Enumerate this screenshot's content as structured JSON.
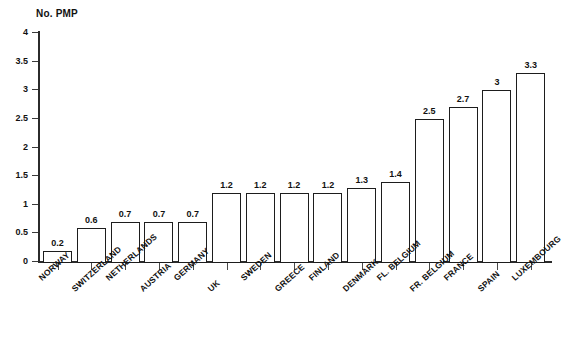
{
  "chart_data": {
    "type": "bar",
    "title": "No. PMP",
    "xlabel": "",
    "ylabel": "No. PMP",
    "ylim": [
      0,
      4
    ],
    "ytick_labels": [
      "0",
      "0.5",
      "1",
      "1.5",
      "2",
      "2.5",
      "3",
      "3.5",
      "4"
    ],
    "ytick_values": [
      0,
      0.5,
      1,
      1.5,
      2,
      2.5,
      3,
      3.5,
      4
    ],
    "grid": false,
    "legend": "none",
    "bar_style": {
      "fill": "#ffffff",
      "edge": "#1d1d1d"
    },
    "categories": [
      "NORWAY",
      "SWITZERLAND",
      "NETHERLANDS",
      "AUSTRIA",
      "GERMANY",
      "UK",
      "SWEDEN",
      "GREECE",
      "FINLAND",
      "DENMARK",
      "FL. BELGIUM",
      "FR. BELGIUM",
      "FRANCE",
      "SPAIN",
      "LUXEMBOURG"
    ],
    "values": [
      0.2,
      0.6,
      0.7,
      0.7,
      0.7,
      1.2,
      1.2,
      1.2,
      1.2,
      1.3,
      1.4,
      2.5,
      2.7,
      3,
      3.3
    ],
    "value_labels": [
      "0.2",
      "0.6",
      "0.7",
      "0.7",
      "0.7",
      "1.2",
      "1.2",
      "1.2",
      "1.2",
      "1.3",
      "1.4",
      "2.5",
      "2.7",
      "3",
      "3.3"
    ]
  }
}
